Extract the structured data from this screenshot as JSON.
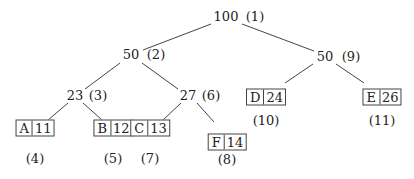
{
  "diagram": {
    "type": "huffman-tree",
    "internal_nodes": [
      {
        "id": "n1",
        "weight": "100",
        "order": "(1)",
        "x": 226,
        "y": 17,
        "ox": 255
      },
      {
        "id": "n2",
        "weight": "50",
        "order": "(2)",
        "x": 131,
        "y": 55,
        "ox": 156
      },
      {
        "id": "n3",
        "weight": "23",
        "order": "(3)",
        "x": 75,
        "y": 96,
        "ox": 98
      },
      {
        "id": "n6",
        "weight": "27",
        "order": "(6)",
        "x": 188,
        "y": 96,
        "ox": 211
      },
      {
        "id": "n9",
        "weight": "50",
        "order": "(9)",
        "x": 325,
        "y": 57,
        "ox": 351
      }
    ],
    "leaves": [
      {
        "id": "A",
        "symbol": "A",
        "count": "11",
        "order": "(4)",
        "x": 35,
        "y": 128,
        "oy": 159
      },
      {
        "id": "B",
        "symbol": "B",
        "count": "12",
        "order": "(5)",
        "x": 113,
        "y": 128,
        "oy": 159
      },
      {
        "id": "C",
        "symbol": "C",
        "count": "13",
        "order": "(7)",
        "x": 150,
        "y": 128,
        "oy": 159
      },
      {
        "id": "F",
        "symbol": "F",
        "count": "14",
        "order": "(8)",
        "x": 227,
        "y": 142,
        "oy": 160
      },
      {
        "id": "D",
        "symbol": "D",
        "count": "24",
        "order": "(10)",
        "x": 266,
        "y": 97,
        "oy": 121
      },
      {
        "id": "E",
        "symbol": "E",
        "count": "26",
        "order": "(11)",
        "x": 382,
        "y": 97,
        "oy": 121
      }
    ],
    "edges": [
      {
        "from": "n1",
        "to": "n2",
        "x1": 211,
        "y1": 24,
        "x2": 143,
        "y2": 50
      },
      {
        "from": "n1",
        "to": "n9",
        "x1": 242,
        "y1": 24,
        "x2": 314,
        "y2": 51
      },
      {
        "from": "n2",
        "to": "n3",
        "x1": 120,
        "y1": 63,
        "x2": 85,
        "y2": 89
      },
      {
        "from": "n2",
        "to": "n6",
        "x1": 142,
        "y1": 63,
        "x2": 178,
        "y2": 89
      },
      {
        "from": "n3",
        "to": "A",
        "x1": 68,
        "y1": 103,
        "x2": 48,
        "y2": 120
      },
      {
        "from": "n3",
        "to": "B",
        "x1": 83,
        "y1": 103,
        "x2": 102,
        "y2": 120
      },
      {
        "from": "n6",
        "to": "C",
        "x1": 181,
        "y1": 103,
        "x2": 163,
        "y2": 120
      },
      {
        "from": "n6",
        "to": "F",
        "x1": 197,
        "y1": 103,
        "x2": 214,
        "y2": 122
      },
      {
        "from": "n9",
        "to": "D",
        "x1": 313,
        "y1": 64,
        "x2": 285,
        "y2": 83
      },
      {
        "from": "n9",
        "to": "E",
        "x1": 336,
        "y1": 64,
        "x2": 364,
        "y2": 83
      }
    ],
    "colors": {
      "line": "#444444",
      "text": "#222222",
      "background": "#ffffff"
    }
  }
}
